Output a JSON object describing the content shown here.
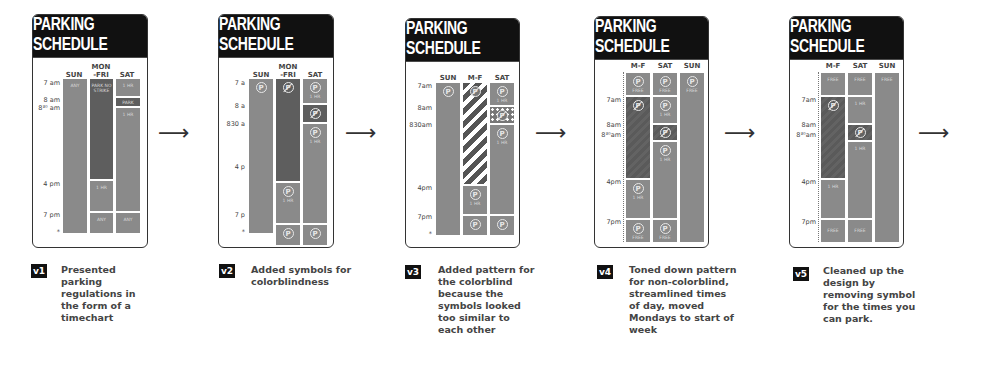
{
  "card_title": "PARKING SCHEDULE",
  "arrow_glyph": "⟶",
  "symbols": {
    "park": "P",
    "no_park": "P"
  },
  "versions": [
    {
      "badge": "v1",
      "caption": "Presented parking regulations in the form of a timechart",
      "columns": [
        "SUN",
        "MON -FRI",
        "SAT"
      ],
      "ticks": [
        "7 am",
        "8 am",
        "8³⁰ am",
        "4 pm",
        "7 pm",
        "*"
      ],
      "labels": {
        "sun_top": "ANY",
        "mf_top": "PARK NO STRIKE",
        "mf_mid": "1 HR",
        "mf_bot": "ANY",
        "sat_1": "1 HR",
        "sat_2": "PARK",
        "sat_3": "1 HR",
        "sat_bot": "ANY"
      }
    },
    {
      "badge": "v2",
      "caption": "Added symbols for colorblindness",
      "columns": [
        "SUN",
        "MON -FRI",
        "SAT"
      ],
      "ticks": [
        "7 a",
        "8 a",
        "830 a",
        "4 p",
        "7 p",
        "*"
      ],
      "labels": {
        "sat_1": "1 HR",
        "sat_3": "1 HR",
        "mf_mid": "1 HR"
      }
    },
    {
      "badge": "v3",
      "caption": "Added pattern for the colorblind because the symbols looked too similar to each other",
      "columns": [
        "SUN",
        "M-F",
        "SAT"
      ],
      "ticks": [
        "7am",
        "8am",
        "830am",
        "4pm",
        "7pm",
        "*"
      ],
      "labels": {
        "sat_1": "1 HR",
        "sat_3": "1 HR",
        "mf_mid": "1 HR"
      }
    },
    {
      "badge": "v4",
      "caption": "Toned down pattern for non-colorblind, streamlined times of day, moved Mondays to start of week",
      "columns": [
        "M-F",
        "SAT",
        "SUN"
      ],
      "ticks": [
        "7am",
        "8am",
        "8³⁰am",
        "4pm",
        "7pm"
      ],
      "labels": {
        "free": "FREE",
        "hr": "1 HR"
      }
    },
    {
      "badge": "v5",
      "caption": "Cleaned up the design by removing symbol for the times you can park.",
      "columns": [
        "M-F",
        "SAT",
        "SUN"
      ],
      "ticks": [
        "7am",
        "8am",
        "8³⁰am",
        "4pm",
        "7pm"
      ],
      "labels": {
        "free": "FREE",
        "hr": "1 HR"
      }
    }
  ]
}
